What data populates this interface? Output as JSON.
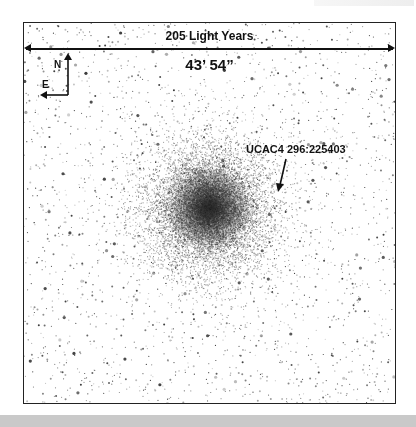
{
  "figure": {
    "scale_label": "205 Light Years",
    "angular_size": "43’ 54”",
    "compass": {
      "north": "N",
      "east": "E"
    },
    "target_label": "UCAC4 296:225403"
  },
  "colors": {
    "background": "#ffffff",
    "stars": "#111111",
    "frame": "#222222",
    "bottom_band": "#c9c9c9"
  }
}
